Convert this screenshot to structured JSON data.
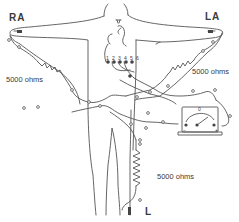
{
  "diagram": {
    "title": "",
    "leads": {
      "right_arm": "RA",
      "left_arm": "LA",
      "left_leg": "L"
    },
    "resistors": {
      "right_arm": "5000 ohms",
      "left_arm": "5000 ohms",
      "leg": "5000 ohms"
    },
    "chest_electrodes": [
      "1",
      "2",
      "3",
      "4",
      "5",
      "6"
    ],
    "galvanometer": {
      "zero_mark": "0",
      "minus_mark": "−",
      "plus_mark": "+"
    },
    "line_color": "#555555",
    "background": "#ffffff"
  }
}
